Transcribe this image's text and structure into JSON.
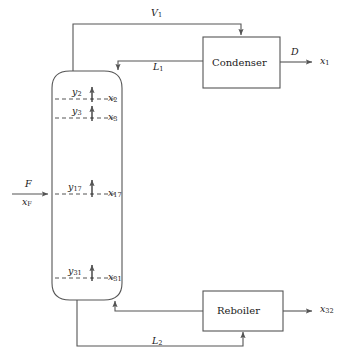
{
  "diagram": {
    "stroke_color": "#555555",
    "text_color": "#1a1a1a",
    "background": "#ffffff"
  },
  "units": {
    "column": {
      "name": "distillation-column",
      "label": ""
    },
    "condenser": {
      "name": "condenser",
      "label": "Condenser"
    },
    "reboiler": {
      "name": "reboiler",
      "label": "Reboiler"
    }
  },
  "streams": {
    "vapor_top": {
      "label": "V",
      "sub": "1"
    },
    "reflux": {
      "label": "L",
      "sub": "1"
    },
    "distillate": {
      "label": "D",
      "sub": ""
    },
    "distillate_comp": {
      "label": "x",
      "sub": "1"
    },
    "feed": {
      "label": "F",
      "sub": ""
    },
    "feed_comp": {
      "label": "x",
      "sub": "F"
    },
    "bottoms_liquid": {
      "label": "L",
      "sub": "2"
    },
    "bottoms_comp": {
      "label": "x",
      "sub": "32"
    }
  },
  "trays": [
    {
      "name": "tray-2",
      "vapor": "y",
      "vapor_sub": "2",
      "liquid": "x",
      "liquid_sub": "2",
      "y": 99
    },
    {
      "name": "tray-3",
      "vapor": "y",
      "vapor_sub": "3",
      "liquid": "x",
      "liquid_sub": "3",
      "y": 118
    },
    {
      "name": "tray-17",
      "vapor": "y",
      "vapor_sub": "17",
      "liquid": "x",
      "liquid_sub": "17",
      "y": 194
    },
    {
      "name": "tray-31",
      "vapor": "y",
      "vapor_sub": "31",
      "liquid": "x",
      "liquid_sub": "31",
      "y": 278
    }
  ]
}
